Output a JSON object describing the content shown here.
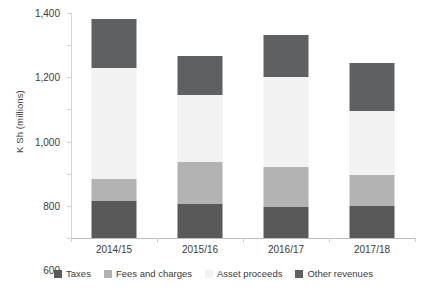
{
  "chart_data": {
    "type": "bar",
    "subtype": "stacked-bar",
    "title": "",
    "xlabel": "",
    "ylabel": "K Sh (millions)",
    "ylim": [
      0,
      1400
    ],
    "yticks": [
      0,
      200,
      400,
      600,
      800,
      1000,
      1200,
      1400
    ],
    "ytick_labels": [
      "0",
      "200",
      "400",
      "600",
      "800",
      "1,000",
      "1,200",
      "1,400"
    ],
    "grid": false,
    "legend_position": "bottom",
    "categories": [
      "2014/15",
      "2015/16",
      "2016/17",
      "2017/18"
    ],
    "series": [
      {
        "name": "Taxes",
        "color": "#595959",
        "values": [
          230,
          210,
          195,
          200
        ]
      },
      {
        "name": "Fees and charges",
        "color": "#b3b3b3",
        "values": [
          140,
          260,
          245,
          190
        ]
      },
      {
        "name": "Asset proceeds",
        "color": "#f2f2f2",
        "values": [
          690,
          420,
          560,
          400
        ]
      },
      {
        "name": "Other revenues",
        "color": "#5f6062",
        "values": [
          300,
          240,
          265,
          300
        ]
      }
    ],
    "totals": [
      1360,
      1130,
      1265,
      1090
    ]
  }
}
